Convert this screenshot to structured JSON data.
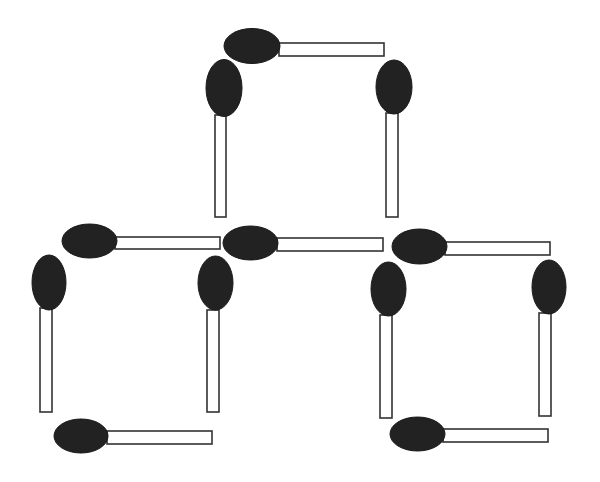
{
  "figure": {
    "title": "Matchstick puzzle: three squares arranged in a pyramid",
    "background": "#ffffff",
    "head_color": "#222222",
    "stick_fill": "#ffffff",
    "stick_outline": "#333333",
    "match_count": 10,
    "square_count": 3
  },
  "matches": [
    {
      "id": "top-square-top",
      "orientation": "horizontal",
      "head": {
        "cx": 252,
        "cy": 46,
        "rx": 28,
        "ry": 17.5
      },
      "stick": {
        "x": 279,
        "y": 43,
        "w": 105,
        "h": 13
      }
    },
    {
      "id": "top-square-left",
      "orientation": "vertical",
      "head": {
        "cx": 224,
        "cy": 88,
        "rx": 18,
        "ry": 28.5
      },
      "stick": {
        "x": 215,
        "y": 115,
        "w": 11,
        "h": 102
      }
    },
    {
      "id": "top-square-right",
      "orientation": "vertical",
      "head": {
        "cx": 394,
        "cy": 87,
        "rx": 18,
        "ry": 27
      },
      "stick": {
        "x": 386,
        "y": 113,
        "w": 12,
        "h": 104
      }
    },
    {
      "id": "left-square-top",
      "orientation": "horizontal",
      "head": {
        "cx": 89.5,
        "cy": 241,
        "rx": 27.5,
        "ry": 17
      },
      "stick": {
        "x": 115,
        "y": 237,
        "w": 105,
        "h": 12
      }
    },
    {
      "id": "middle-shared-top",
      "orientation": "horizontal",
      "head": {
        "cx": 250.5,
        "cy": 243,
        "rx": 27.5,
        "ry": 17
      },
      "stick": {
        "x": 277,
        "y": 238,
        "w": 106,
        "h": 13
      }
    },
    {
      "id": "right-square-top",
      "orientation": "horizontal",
      "head": {
        "cx": 419.5,
        "cy": 246.5,
        "rx": 27.5,
        "ry": 17.5
      },
      "stick": {
        "x": 445,
        "y": 242,
        "w": 105,
        "h": 13
      }
    },
    {
      "id": "left-square-left",
      "orientation": "vertical",
      "head": {
        "cx": 49,
        "cy": 282.5,
        "rx": 17,
        "ry": 27.5
      },
      "stick": {
        "x": 40,
        "y": 308,
        "w": 12,
        "h": 104
      }
    },
    {
      "id": "left-square-right",
      "orientation": "vertical",
      "head": {
        "cx": 215.5,
        "cy": 283,
        "rx": 17.5,
        "ry": 27
      },
      "stick": {
        "x": 207,
        "y": 310,
        "w": 12,
        "h": 102
      }
    },
    {
      "id": "right-square-left",
      "orientation": "vertical",
      "head": {
        "cx": 388.5,
        "cy": 289,
        "rx": 17.5,
        "ry": 27
      },
      "stick": {
        "x": 380,
        "y": 315,
        "w": 12,
        "h": 103
      }
    },
    {
      "id": "right-square-right",
      "orientation": "vertical",
      "head": {
        "cx": 549,
        "cy": 287,
        "rx": 17,
        "ry": 27
      },
      "stick": {
        "x": 539,
        "y": 313,
        "w": 12,
        "h": 103
      }
    },
    {
      "id": "left-square-bottom",
      "orientation": "horizontal",
      "head": {
        "cx": 81,
        "cy": 436,
        "rx": 27,
        "ry": 17
      },
      "stick": {
        "x": 107,
        "y": 431,
        "w": 105,
        "h": 13
      }
    },
    {
      "id": "right-square-bottom",
      "orientation": "horizontal",
      "head": {
        "cx": 417.5,
        "cy": 434,
        "rx": 27.5,
        "ry": 17
      },
      "stick": {
        "x": 443,
        "y": 429,
        "w": 105,
        "h": 13
      }
    }
  ]
}
